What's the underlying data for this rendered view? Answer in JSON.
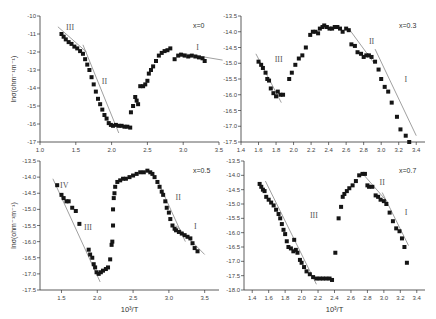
{
  "figure": {
    "panels_count": 4,
    "shared_xlabel": "10³/T"
  },
  "chart_data": [
    {
      "type": "scatter",
      "panel": "top-left",
      "title": "",
      "annotation": "x=0",
      "xlabel": "",
      "ylabel": "lnσ(ohm⁻¹m⁻¹)",
      "xlim": [
        1.0,
        3.5
      ],
      "ylim": [
        -17,
        -10
      ],
      "xticks": [
        "1.0",
        "1.5",
        "2.0",
        "2.5",
        "3.0",
        "3.5"
      ],
      "yticks": [
        "-10",
        "-11",
        "-12",
        "-13",
        "-14",
        "-15",
        "-16",
        "-17"
      ],
      "regions": [
        {
          "label": "III",
          "x": 1.42,
          "y": -10.8
        },
        {
          "label": "II",
          "x": 1.9,
          "y": -13.8
        },
        {
          "label": "I",
          "x": 3.2,
          "y": -11.9
        }
      ],
      "fit_lines": [
        {
          "x": [
            1.25,
            1.65
          ],
          "y": [
            -10.6,
            -12.0
          ]
        },
        {
          "x": [
            1.6,
            2.1
          ],
          "y": [
            -11.6,
            -16.5
          ]
        },
        {
          "x": [
            2.95,
            3.55
          ],
          "y": [
            -12.05,
            -12.45
          ]
        }
      ],
      "series": [
        {
          "name": "x=0",
          "x": [
            1.3,
            1.33,
            1.36,
            1.4,
            1.44,
            1.48,
            1.52,
            1.56,
            1.6,
            1.63,
            1.66,
            1.69,
            1.72,
            1.75,
            1.78,
            1.81,
            1.84,
            1.87,
            1.9,
            1.93,
            1.96,
            1.99,
            2.02,
            2.06,
            2.1,
            2.14,
            2.18,
            2.22,
            2.26,
            2.27,
            2.3,
            2.33,
            2.35,
            2.37,
            2.4,
            2.44,
            2.47,
            2.5,
            2.52,
            2.55,
            2.58,
            2.62,
            2.66,
            2.7,
            2.74,
            2.78,
            2.82,
            2.88,
            2.93,
            2.97,
            3.02,
            3.07,
            3.12,
            3.17,
            3.22,
            3.27,
            3.3
          ],
          "y": [
            -11.0,
            -11.15,
            -11.3,
            -11.45,
            -11.55,
            -11.7,
            -11.8,
            -11.95,
            -12.1,
            -12.4,
            -12.7,
            -13.0,
            -13.4,
            -13.8,
            -14.2,
            -14.6,
            -14.9,
            -15.2,
            -15.5,
            -15.7,
            -15.95,
            -16.05,
            -16.1,
            -16.05,
            -16.1,
            -16.1,
            -16.15,
            -16.15,
            -16.2,
            -15.35,
            -15.0,
            -14.5,
            -14.7,
            -14.9,
            -13.9,
            -13.9,
            -13.8,
            -13.6,
            -13.2,
            -13.0,
            -12.8,
            -12.5,
            -12.2,
            -12.05,
            -11.95,
            -11.9,
            -11.8,
            -12.4,
            -12.2,
            -12.15,
            -12.2,
            -12.25,
            -12.2,
            -12.25,
            -12.3,
            -12.35,
            -12.5
          ]
        }
      ]
    },
    {
      "type": "scatter",
      "panel": "top-right",
      "title": "",
      "annotation": "x=0.3",
      "xlabel": "",
      "ylabel": "",
      "xlim": [
        1.4,
        3.5
      ],
      "ylim": [
        -17.5,
        -13.5
      ],
      "xticks": [
        "1.4",
        "1.6",
        "1.8",
        "2.0",
        "2.2",
        "2.4",
        "2.6",
        "2.8",
        "3.0",
        "3.2",
        "3.4"
      ],
      "yticks": [
        "-13.5",
        "-14.0",
        "-14.5",
        "-15.0",
        "-15.5",
        "-16.0",
        "-16.5",
        "-17.0",
        "-17.5"
      ],
      "regions": [
        {
          "label": "III",
          "x": 1.83,
          "y": -14.95
        },
        {
          "label": "II",
          "x": 2.89,
          "y": -14.4
        },
        {
          "label": "I",
          "x": 3.28,
          "y": -15.6
        }
      ],
      "fit_lines": [
        {
          "x": [
            1.57,
            1.86
          ],
          "y": [
            -14.7,
            -16.25
          ]
        },
        {
          "x": [
            2.63,
            2.92
          ],
          "y": [
            -13.9,
            -15.0
          ]
        },
        {
          "x": [
            2.93,
            3.4
          ],
          "y": [
            -14.55,
            -17.3
          ]
        }
      ],
      "series": [
        {
          "name": "x=0.3",
          "x": [
            1.6,
            1.63,
            1.65,
            1.68,
            1.7,
            1.72,
            1.74,
            1.77,
            1.8,
            1.82,
            1.85,
            1.88,
            1.95,
            1.98,
            2.02,
            2.06,
            2.1,
            2.14,
            2.19,
            2.22,
            2.25,
            2.28,
            2.3,
            2.33,
            2.35,
            2.38,
            2.41,
            2.44,
            2.47,
            2.5,
            2.53,
            2.56,
            2.6,
            2.63,
            2.66,
            2.7,
            2.73,
            2.77,
            2.8,
            2.83,
            2.86,
            2.89,
            2.93,
            2.97,
            3.0,
            3.04,
            3.08,
            3.12,
            3.18,
            3.22,
            3.28,
            3.32
          ],
          "y": [
            -14.95,
            -15.05,
            -15.15,
            -15.3,
            -15.5,
            -15.55,
            -15.8,
            -15.95,
            -16.05,
            -15.9,
            -16.0,
            -16.0,
            -15.5,
            -15.3,
            -15.05,
            -14.85,
            -14.75,
            -14.5,
            -14.1,
            -14.0,
            -14.0,
            -14.05,
            -13.9,
            -13.85,
            -13.8,
            -13.85,
            -13.9,
            -13.9,
            -13.85,
            -13.85,
            -13.9,
            -14.0,
            -13.9,
            -13.95,
            -14.4,
            -14.45,
            -14.65,
            -14.7,
            -14.8,
            -14.75,
            -14.75,
            -14.8,
            -14.95,
            -15.2,
            -15.5,
            -15.75,
            -15.9,
            -16.25,
            -16.7,
            -17.1,
            -17.3,
            -17.5
          ]
        }
      ]
    },
    {
      "type": "scatter",
      "panel": "bottom-left",
      "title": "",
      "annotation": "x=0.5",
      "xlabel": "10³/T",
      "ylabel": "lnσ(ohm⁻¹m⁻¹)",
      "xlim": [
        1.2,
        3.7
      ],
      "ylim": [
        -17.5,
        -13.5
      ],
      "xticks": [
        "1.5",
        "2.0",
        "2.5",
        "3.0",
        "3.5"
      ],
      "yticks": [
        "-13.5",
        "-14.0",
        "-14.5",
        "-15.0",
        "-15.5",
        "-16.0",
        "-16.5",
        "-17.0",
        "-17.5"
      ],
      "regions": [
        {
          "label": "IV",
          "x": 1.54,
          "y": -14.35
        },
        {
          "label": "III",
          "x": 1.87,
          "y": -15.65
        },
        {
          "label": "II",
          "x": 3.13,
          "y": -14.7
        },
        {
          "label": "I",
          "x": 3.37,
          "y": -15.6
        }
      ],
      "fit_lines": [
        {
          "x": [
            1.38,
            2.04
          ],
          "y": [
            -14.05,
            -17.25
          ]
        },
        {
          "x": [
            2.86,
            3.23
          ],
          "y": [
            -14.2,
            -16.0
          ]
        },
        {
          "x": [
            3.1,
            3.5
          ],
          "y": [
            -15.5,
            -16.4
          ]
        }
      ],
      "series": [
        {
          "name": "x=0.5",
          "x": [
            1.44,
            1.5,
            1.53,
            1.57,
            1.6,
            1.65,
            1.7,
            1.75,
            1.88,
            1.9,
            1.93,
            1.95,
            1.97,
            1.99,
            2.02,
            2.05,
            2.08,
            2.12,
            2.15,
            2.18,
            2.2,
            2.21,
            2.22,
            2.22,
            2.23,
            2.24,
            2.25,
            2.28,
            2.32,
            2.36,
            2.4,
            2.45,
            2.5,
            2.55,
            2.6,
            2.65,
            2.7,
            2.74,
            2.77,
            2.8,
            2.84,
            2.87,
            2.9,
            2.92,
            2.95,
            2.97,
            3.0,
            3.02,
            3.05,
            3.08,
            3.1,
            3.14,
            3.18,
            3.22,
            3.26,
            3.3,
            3.33,
            3.36,
            3.4
          ],
          "y": [
            -14.25,
            -14.55,
            -14.65,
            -14.75,
            -14.75,
            -14.95,
            -15.05,
            -15.45,
            -16.25,
            -16.4,
            -16.5,
            -16.7,
            -16.8,
            -16.95,
            -17.0,
            -16.95,
            -16.9,
            -16.85,
            -16.8,
            -16.55,
            -16.1,
            -16.0,
            -15.5,
            -15.0,
            -14.65,
            -14.5,
            -14.3,
            -14.15,
            -14.1,
            -14.05,
            -14.05,
            -14.0,
            -13.95,
            -13.9,
            -13.85,
            -13.85,
            -13.8,
            -13.85,
            -13.9,
            -14.0,
            -14.15,
            -14.3,
            -14.45,
            -14.55,
            -14.75,
            -14.95,
            -15.1,
            -15.3,
            -15.5,
            -15.6,
            -15.65,
            -15.7,
            -15.75,
            -15.8,
            -15.85,
            -15.9,
            -16.05,
            -16.2,
            -16.3
          ]
        }
      ]
    },
    {
      "type": "scatter",
      "panel": "bottom-right",
      "title": "",
      "annotation": "x=0.7",
      "xlabel": "10³/T",
      "ylabel": "",
      "xlim": [
        1.3,
        3.5
      ],
      "ylim": [
        -18.0,
        -13.5
      ],
      "xticks": [
        "1.4",
        "1.6",
        "1.8",
        "2.0",
        "2.2",
        "2.4",
        "2.6",
        "2.8",
        "3.0",
        "3.2",
        "3.4"
      ],
      "yticks": [
        "-13.5",
        "-14.0",
        "-14.5",
        "-15.0",
        "-15.5",
        "-16.0",
        "-16.5",
        "-17.0",
        "-17.5",
        "-18.0"
      ],
      "regions": [
        {
          "label": "III",
          "x": 2.15,
          "y": -15.5
        },
        {
          "label": "II",
          "x": 2.98,
          "y": -14.35
        },
        {
          "label": "I",
          "x": 3.27,
          "y": -15.4
        }
      ],
      "fit_lines": [
        {
          "x": [
            1.56,
            2.18
          ],
          "y": [
            -14.2,
            -17.8
          ]
        },
        {
          "x": [
            2.73,
            3.05
          ],
          "y": [
            -13.9,
            -14.95
          ]
        },
        {
          "x": [
            2.98,
            3.3
          ],
          "y": [
            -14.6,
            -16.45
          ]
        }
      ],
      "series": [
        {
          "name": "x=0.7",
          "x": [
            1.49,
            1.51,
            1.53,
            1.55,
            1.57,
            1.6,
            1.63,
            1.66,
            1.69,
            1.72,
            1.74,
            1.76,
            1.78,
            1.8,
            1.82,
            1.84,
            1.87,
            1.9,
            1.91,
            1.93,
            1.95,
            1.98,
            2.0,
            2.03,
            2.06,
            2.1,
            2.14,
            2.18,
            2.22,
            2.26,
            2.3,
            2.34,
            2.37,
            2.41,
            2.45,
            2.48,
            2.5,
            2.52,
            2.55,
            2.58,
            2.62,
            2.66,
            2.7,
            2.74,
            2.77,
            2.8,
            2.82,
            2.86,
            2.9,
            2.93,
            2.96,
            3.0,
            3.03,
            3.07,
            3.11,
            3.15,
            3.19,
            3.22,
            3.25,
            3.28
          ],
          "y": [
            -14.3,
            -14.4,
            -14.5,
            -14.55,
            -14.75,
            -14.85,
            -14.95,
            -15.05,
            -15.2,
            -15.35,
            -15.5,
            -15.7,
            -15.9,
            -16.05,
            -16.3,
            -16.5,
            -16.55,
            -16.65,
            -16.25,
            -16.6,
            -16.7,
            -16.95,
            -17.05,
            -17.2,
            -17.35,
            -17.45,
            -17.55,
            -17.6,
            -17.6,
            -17.6,
            -17.6,
            -17.6,
            -17.65,
            -16.7,
            -15.5,
            -15.1,
            -14.75,
            -14.65,
            -14.55,
            -14.45,
            -14.35,
            -14.2,
            -14.0,
            -13.95,
            -13.95,
            -14.35,
            -14.4,
            -14.4,
            -14.7,
            -14.75,
            -14.85,
            -14.9,
            -15.0,
            -15.3,
            -15.6,
            -15.85,
            -15.95,
            -16.2,
            -16.5,
            -17.05
          ]
        }
      ]
    }
  ]
}
